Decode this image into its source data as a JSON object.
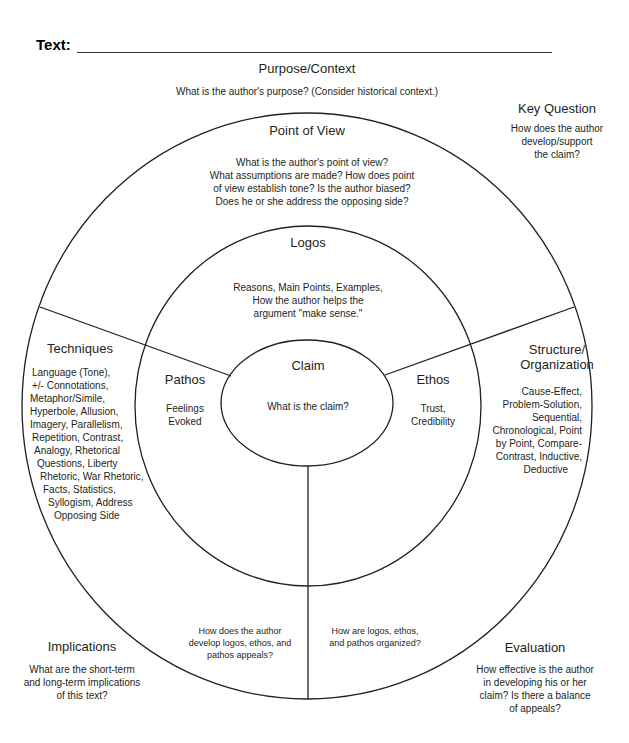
{
  "worksheet": {
    "text_label": "Text:",
    "text_field_value": ""
  },
  "purpose_context": {
    "heading": "Purpose/Context",
    "prompt": "What is the author's purpose? (Consider historical context.)"
  },
  "key_question": {
    "heading": "Key Question",
    "lines": [
      "How does the author",
      "develop/support",
      "the claim?"
    ]
  },
  "point_of_view": {
    "heading": "Point of View",
    "lines": [
      "What is the author's point of view?",
      "What assumptions are made? How does point",
      "of view establish tone? Is the author biased?",
      "Does he or she address the opposing side?"
    ]
  },
  "logos": {
    "heading": "Logos",
    "lines": [
      "Reasons, Main Points, Examples,",
      "How the author helps the",
      "argument \"make sense.\""
    ]
  },
  "claim": {
    "heading": "Claim",
    "prompt": "What is the claim?"
  },
  "pathos": {
    "heading": "Pathos",
    "lines": [
      "Feelings",
      "Evoked"
    ]
  },
  "ethos": {
    "heading": "Ethos",
    "lines": [
      "Trust,",
      "Credibility"
    ]
  },
  "techniques": {
    "heading": "Techniques",
    "lines": [
      "Language (Tone),",
      "+/- Connotations,",
      "Metaphor/Simile,",
      "Hyperbole, Allusion,",
      "Imagery, Parallelism,",
      "Repetition, Contrast,",
      "Analogy, Rhetorical",
      "Questions, Liberty",
      "Rhetoric, War Rhetoric,",
      "Facts, Statistics,",
      "Syllogism, Address",
      "Opposing Side"
    ]
  },
  "structure": {
    "heading_lines": [
      "Structure/",
      "Organization"
    ],
    "lines": [
      "Cause-Effect,",
      "Problem-Solution,",
      "Sequential,",
      "Chronological, Point",
      "by Point, Compare-",
      "Contrast, Inductive,",
      "Deductive"
    ]
  },
  "bottom_left_prompt": {
    "lines": [
      "How does the author",
      "develop logos, ethos, and",
      "pathos appeals?"
    ]
  },
  "bottom_right_prompt": {
    "lines": [
      "How are logos, ethos,",
      "and pathos organized?"
    ]
  },
  "implications": {
    "heading": "Implications",
    "lines": [
      "What are the short-term",
      "and long-term implications",
      "of this text?"
    ]
  },
  "evaluation": {
    "heading": "Evaluation",
    "lines": [
      "How effective is the author",
      "in developing his or her",
      "claim? Is there a balance",
      "of appeals?"
    ]
  },
  "colors": {
    "stroke": "#231f20",
    "text": "#231f20",
    "background": "#ffffff"
  }
}
